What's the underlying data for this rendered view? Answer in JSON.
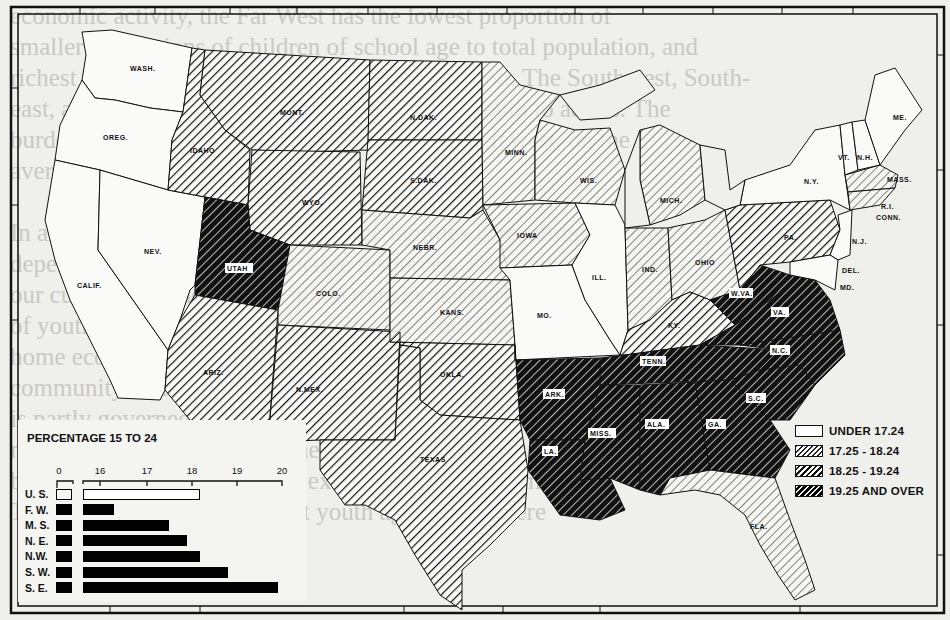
{
  "page": {
    "bleed_through_text": [
      "economic activity, the Far West has the lowest proportion of",
      "smaller proportions of children of school age to total population, and",
      "richest resources from which to support education. The Southwest, South-",
      "east, and Southeast, have the highest ratios of youth to adults. The",
      "burden will be heaviest where the resources are fewest, on the",
      "average.",
      "",
      "In all regions the growing up of large families is resulting in heavy",
      "dependency on limited productive resources. The young people in",
      "our culture find themselves in the transitional period",
      "of youth, neither children nor adults, for proof that the",
      "home economic structure depends on them. Their separate",
      "community is far from adequate. Their status in society",
      "is partly governed by the economic status of their parents and",
      "must reconcile the freedom they enjoy with responsibility exercised, and this",
      "basis military service may be exacted of the newly maturing",
      "The 1930 Census showed that youth aged 15-19 were"
    ]
  },
  "legend": {
    "items": [
      {
        "label": "UNDER 17.24",
        "class": 0
      },
      {
        "label": "17.25 - 18.24",
        "class": 1
      },
      {
        "label": "18.25 - 19.24",
        "class": 2
      },
      {
        "label": "19.25 AND OVER",
        "class": 3
      }
    ]
  },
  "inset": {
    "title": "PERCENTAGE 15 TO 24",
    "axis_ticks": [
      "0",
      "16",
      "17",
      "18",
      "19",
      "20"
    ]
  },
  "chart_data": [
    {
      "type": "bar",
      "title": "PERCENTAGE 15 TO 24",
      "orientation": "horizontal",
      "categories": [
        "U. S.",
        "F. W.",
        "M. S.",
        "N. E.",
        "N.W.",
        "S. W.",
        "S. E."
      ],
      "values": [
        18.2,
        16.3,
        17.5,
        17.9,
        18.2,
        18.8,
        19.9
      ],
      "highlight": {
        "U. S.": "hollow (national total)"
      },
      "xlabel": "",
      "ylabel": "",
      "axis_break": "0 to ~15.5 (broken axis)",
      "xlim": [
        15.5,
        20
      ],
      "ticks": [
        0,
        16,
        17,
        18,
        19,
        20
      ],
      "grid": false
    },
    {
      "type": "heatmap",
      "subtype": "choropleth map",
      "title": "Percentage of population aged 15 to 24, by state",
      "legend_position": "lower right",
      "classes": [
        "UNDER 17.24",
        "17.25 - 18.24",
        "18.25 - 19.24",
        "19.25 AND OVER"
      ],
      "states": {
        "UNDER 17.24": [
          "WASH.",
          "OREG.",
          "CALIF.",
          "NEV.",
          "MO.",
          "ILL.",
          "N.Y.",
          "VT.",
          "N.H.",
          "ME.",
          "N.J.",
          "DEL.",
          "MD."
        ],
        "17.25 - 18.24": [
          "MINN.",
          "WIS.",
          "MICH.",
          "IOWA",
          "NEBR.",
          "COLO.",
          "KANS.",
          "IND.",
          "OHIO",
          "MASS.",
          "R.I.",
          "CONN.",
          "FLA."
        ],
        "18.25 - 19.24": [
          "MONT.",
          "IDAHO",
          "WYO.",
          "N.DAK.",
          "S.DAK.",
          "ARIZ.",
          "N.MEX.",
          "OKLA.",
          "TEXAS",
          "KY.",
          "PA."
        ],
        "19.25 AND OVER": [
          "UTAH",
          "W.VA.",
          "VA.",
          "N.C.",
          "S.C.",
          "TENN.",
          "ARK.",
          "LA.",
          "MISS.",
          "ALA.",
          "GA."
        ]
      }
    }
  ],
  "map": {
    "labels": {
      "wash": "WASH.",
      "oreg": "OREG.",
      "calif": "CALIF.",
      "nev": "NEV.",
      "idaho": "IDAHO",
      "mont": "MONT.",
      "wyo": "WYO.",
      "utah": "UTAH",
      "colo": "COLO.",
      "ariz": "ARIZ.",
      "nmex": "N.MEX.",
      "ndak": "N.DAK.",
      "sdak": "S.DAK.",
      "nebr": "NEBR.",
      "kans": "KANS.",
      "okla": "OKLA.",
      "texas": "TEXAS",
      "minn": "MINN.",
      "iowa": "IOWA",
      "mo": "MO.",
      "ark": "ARK.",
      "la": "LA.",
      "wis": "WIS.",
      "ill": "ILL.",
      "mich": "MICH.",
      "ind": "IND.",
      "ohio": "OHIO",
      "ky": "KY.",
      "tenn": "TENN.",
      "miss": "MISS.",
      "ala": "ALA.",
      "ga": "GA.",
      "fla": "FLA.",
      "sc": "S.C.",
      "nc": "N.C.",
      "va": "VA.",
      "wva": "W.VA.",
      "pa": "PA.",
      "ny": "N.Y.",
      "nj": "N.J.",
      "del": "DEL.",
      "md": "MD.",
      "vt": "VT.",
      "nh": "N.H.",
      "me": "ME.",
      "mass": "MASS.",
      "ri": "R.I.",
      "conn": "CONN."
    }
  }
}
